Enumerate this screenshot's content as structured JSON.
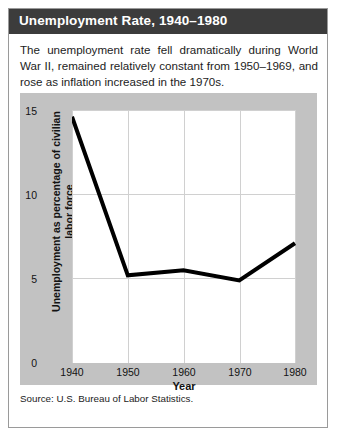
{
  "figure": {
    "title": "Unemployment Rate, 1940–1980",
    "caption": "The unemployment rate fell dramatically during World War II, remained relatively constant from 1950–1969, and rose as inflation increased in the 1970s.",
    "source": "Source: U.S. Bureau of Labor Statistics."
  },
  "colors": {
    "header_background": "#3c3c3c",
    "header_text": "#ffffff",
    "panel_background": "#c2c2c2",
    "plot_background": "#ffffff",
    "line": "#000000",
    "gridline": "#d0d0d0",
    "card_border": "#9a9a9a"
  },
  "chart_data": {
    "type": "line",
    "title": "Unemployment Rate, 1940–1980",
    "xlabel": "Year",
    "ylabel": "Unemployment as percentage of civilian labor force",
    "x": [
      1940,
      1950,
      1960,
      1970,
      1980
    ],
    "values": [
      14.6,
      5.2,
      5.5,
      4.9,
      7.1
    ],
    "xlim": [
      1940,
      1980
    ],
    "ylim": [
      0,
      15
    ],
    "xticks": [
      1940,
      1950,
      1960,
      1970,
      1980
    ],
    "xtick_labels": [
      "1940",
      "1950",
      "1960",
      "1970",
      "1980"
    ],
    "yticks": [
      0,
      5,
      10,
      15
    ],
    "ytick_labels": [
      "0",
      "5",
      "10",
      "15"
    ],
    "grid": true,
    "legend": false,
    "series": [
      {
        "name": "Unemployment rate",
        "values": [
          14.6,
          5.2,
          5.5,
          4.9,
          7.1
        ]
      }
    ]
  }
}
